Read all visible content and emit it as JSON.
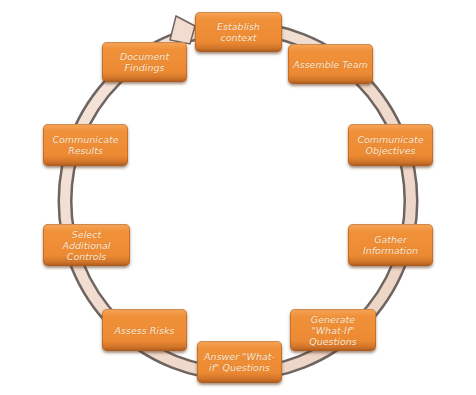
{
  "diagram": {
    "type": "cycle",
    "colors": {
      "box_fill": "#F0913A",
      "box_text": "#FBE9D6",
      "ring_fill": "#F2DCCF",
      "ring_edge": "#6E6460"
    },
    "steps": [
      {
        "label": "Establish context"
      },
      {
        "label": "Assemble Team"
      },
      {
        "label": "Communicate Objectives"
      },
      {
        "label": "Gather Information"
      },
      {
        "label": "Generate \"What-If\" Questions"
      },
      {
        "label": "Answer \"What-if\" Questions"
      },
      {
        "label": "Assess Risks"
      },
      {
        "label": "Select Additional Controls"
      },
      {
        "label": "Communicate Results"
      },
      {
        "label": "Document Findings"
      }
    ]
  }
}
